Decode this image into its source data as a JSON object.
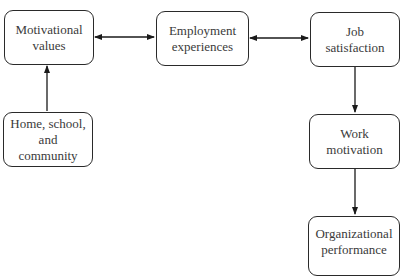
{
  "diagram": {
    "type": "flowchart",
    "nodes": [
      {
        "id": "motivational-values",
        "label": "Motivational\nvalues"
      },
      {
        "id": "employment-experiences",
        "label": "Employment\nexperiences"
      },
      {
        "id": "job-satisfaction",
        "label": "Job\nsatisfaction"
      },
      {
        "id": "home-school-community",
        "label": "Home, school,\nand community"
      },
      {
        "id": "work-motivation",
        "label": "Work\nmotivation"
      },
      {
        "id": "organizational-performance",
        "label": "Organizational\nperformance"
      }
    ],
    "edges": [
      {
        "from": "motivational-values",
        "to": "employment-experiences",
        "direction": "both"
      },
      {
        "from": "employment-experiences",
        "to": "job-satisfaction",
        "direction": "both"
      },
      {
        "from": "home-school-community",
        "to": "motivational-values",
        "direction": "forward"
      },
      {
        "from": "job-satisfaction",
        "to": "work-motivation",
        "direction": "forward"
      },
      {
        "from": "work-motivation",
        "to": "organizational-performance",
        "direction": "forward"
      }
    ],
    "colors": {
      "stroke": "#2a2a2a",
      "text": "#3a3a3a",
      "background": "#ffffff"
    }
  }
}
